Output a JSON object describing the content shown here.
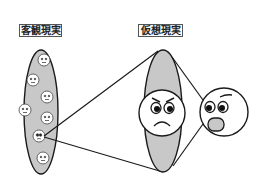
{
  "labels": {
    "objective_reality": "客観現実",
    "virtual_reality": "仮想現実"
  },
  "colors": {
    "background": "#ffffff",
    "stroke": "#1a1a1a",
    "fill_gray": "#c8c8c8",
    "face_fill": "#ffffff",
    "mouth_fill": "#c8c8c8"
  },
  "diagram": {
    "objective_ellipse": {
      "cx": 41,
      "cy": 112,
      "rx": 17,
      "ry": 62
    },
    "small_faces": [
      {
        "cx": 44,
        "cy": 60
      },
      {
        "cx": 33,
        "cy": 80
      },
      {
        "cx": 47,
        "cy": 97
      },
      {
        "cx": 25,
        "cy": 110
      },
      {
        "cx": 47,
        "cy": 118
      },
      {
        "cx": 39,
        "cy": 136,
        "highlighted": true
      },
      {
        "cx": 43,
        "cy": 158
      }
    ],
    "projection_lines": [
      {
        "x1": 44,
        "y1": 136,
        "x2": 158,
        "y2": 51
      },
      {
        "x1": 44,
        "y1": 137,
        "x2": 163,
        "y2": 172
      }
    ],
    "virtual_ellipse": {
      "cx": 163,
      "cy": 111,
      "rx": 19,
      "ry": 61
    },
    "angry_face": {
      "cx": 162,
      "cy": 113,
      "r": 23,
      "expression": "angry"
    },
    "surprised_face": {
      "cx": 224,
      "cy": 112,
      "r": 24,
      "expression": "surprised"
    }
  }
}
